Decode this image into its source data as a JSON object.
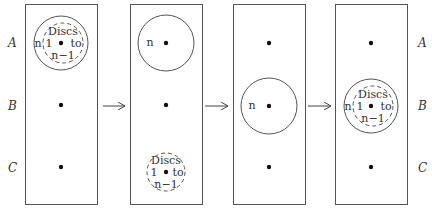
{
  "peg_labels": [
    "A",
    "B",
    "C"
  ],
  "disc_text": {
    "discs_word": "Discs",
    "one": "1",
    "to": "to",
    "n_minus_1": "n−1",
    "n": "n"
  },
  "steps": [
    {
      "step": 1,
      "description": "All discs on A: disc n with discs 1 to n−1 stacked"
    },
    {
      "step": 2,
      "description": "Disc n on A, discs 1 to n−1 moved to C"
    },
    {
      "step": 3,
      "description": "Disc n moved to B"
    },
    {
      "step": 4,
      "description": "Discs 1 to n−1 moved onto disc n at B"
    }
  ],
  "colors": {
    "stroke": "#555555",
    "peg": "#111111",
    "text": "#333333"
  }
}
